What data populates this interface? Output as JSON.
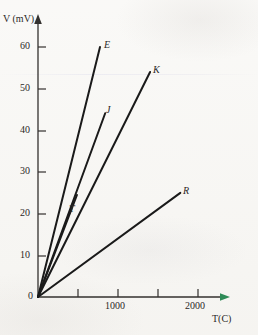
{
  "figure": {
    "background_color": "#f7f6f3",
    "ink_color": "#1a1a1a"
  },
  "chart_data": {
    "type": "line",
    "title": "",
    "xlabel": "T(C)",
    "ylabel": "V (mV)",
    "xlim": [
      0,
      2400
    ],
    "ylim": [
      0,
      65
    ],
    "grid": false,
    "legend": "inline-end-labels",
    "x_ticks": [
      500,
      1000,
      1500,
      2000
    ],
    "x_tick_labels": [
      "",
      "1000",
      "",
      "2000"
    ],
    "y_ticks": [
      0,
      10,
      20,
      30,
      40,
      50,
      60
    ],
    "y_tick_labels": [
      "0",
      "10",
      "20",
      "30",
      "40",
      "50",
      "60"
    ],
    "series": [
      {
        "name": "E",
        "label": "E",
        "x": [
          0,
          780
        ],
        "y": [
          0,
          60.0
        ],
        "slope_mV_per_C": 0.0769
      },
      {
        "name": "K",
        "label": "K",
        "x": [
          0,
          1410
        ],
        "y": [
          0,
          54.0
        ],
        "slope_mV_per_C": 0.0383
      },
      {
        "name": "J",
        "label": "J",
        "x": [
          0,
          845
        ],
        "y": [
          0,
          44.1
        ],
        "slope_mV_per_C": 0.0522
      },
      {
        "name": "T",
        "label": "T",
        "x": [
          0,
          490
        ],
        "y": [
          0,
          24.5
        ],
        "slope_mV_per_C": 0.05
      },
      {
        "name": "R",
        "label": "R",
        "x": [
          0,
          1790
        ],
        "y": [
          0,
          25.0
        ],
        "slope_mV_per_C": 0.014
      }
    ]
  },
  "labels": {
    "y_axis_title": "V (mV)",
    "x_axis_title": "T(C)",
    "y_60": "60",
    "y_50": "50",
    "y_40": "40",
    "y_30": "30",
    "y_20": "20",
    "y_10": "10",
    "y_0": "0",
    "x_1000": "1000",
    "x_2000": "2000",
    "curve_E": "E",
    "curve_K": "K",
    "curve_J": "J",
    "curve_T": "T",
    "curve_R": "R"
  }
}
